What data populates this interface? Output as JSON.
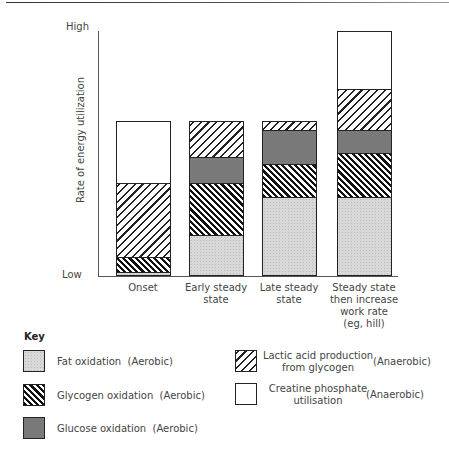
{
  "chart_data": {
    "type": "stacked_bar",
    "title": "",
    "xlabel": "",
    "ylabel": "Rate of energy utilization",
    "y_ticks": [
      "Low",
      "High"
    ],
    "ylim": [
      0,
      100
    ],
    "categories": [
      "Onset",
      "Early steady state",
      "Late steady state",
      "Steady state then increase work rate (eg, hill)"
    ],
    "series": [
      {
        "name": "Fat oxidation (Aerobic)",
        "key": "fat",
        "values": [
          1.2,
          16.4,
          32.0,
          32.0
        ]
      },
      {
        "name": "Glycogen oxidation (Aerobic)",
        "key": "glycogen",
        "values": [
          6.1,
          21.7,
          13.9,
          18.4
        ]
      },
      {
        "name": "Glucose oxidation (Aerobic)",
        "key": "glucose",
        "values": [
          0,
          10.7,
          13.9,
          9.4
        ]
      },
      {
        "name": "Lactic acid production from glycogen (Anaerobic)",
        "key": "lactic",
        "values": [
          30.7,
          14.3,
          3.3,
          16.8
        ]
      },
      {
        "name": "Creatine phosphate utilisation (Anaerobic)",
        "key": "creatine",
        "values": [
          25.0,
          0,
          0,
          23.4
        ]
      }
    ],
    "grid": false,
    "legend_position": "bottom"
  },
  "axis": {
    "high": "High",
    "low": "Low",
    "ylabel": "Rate of energy utilization"
  },
  "categories": [
    {
      "line1": "Onset",
      "line2": "",
      "line3": "",
      "line4": ""
    },
    {
      "line1": "Early steady",
      "line2": "state",
      "line3": "",
      "line4": ""
    },
    {
      "line1": "Late steady",
      "line2": "state",
      "line3": "",
      "line4": ""
    },
    {
      "line1": "Steady state",
      "line2": "then increase",
      "line3": "work rate",
      "line4": "(eg, hill)"
    }
  ],
  "key": {
    "title": "Key",
    "fat": {
      "label": "Fat oxidation",
      "type": "(Aerobic)"
    },
    "glycogen": {
      "label": "Glycogen oxidation",
      "type": "(Aerobic)"
    },
    "glucose": {
      "label": "Glucose oxidation",
      "type": "(Aerobic)"
    },
    "lactic": {
      "line1": "Lactic acid production",
      "line2": "from glycogen",
      "type": "(Anaerobic)"
    },
    "creatine": {
      "line1": "Creatine phosphate",
      "line2": "utilisation",
      "type": "(Anaerobic)"
    }
  }
}
